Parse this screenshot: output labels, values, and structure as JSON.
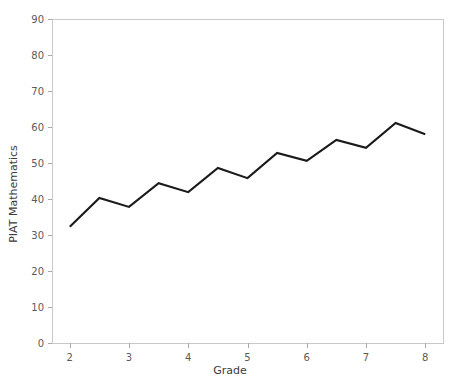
{
  "chart_data": {
    "type": "line",
    "title": "",
    "xlabel": "Grade",
    "ylabel": "PIAT Mathematics",
    "xlim": [
      1.7,
      8.3
    ],
    "ylim": [
      0,
      90
    ],
    "xticks": [
      2,
      3,
      4,
      5,
      6,
      7,
      8
    ],
    "yticks": [
      0,
      10,
      20,
      30,
      40,
      50,
      60,
      70,
      80,
      90
    ],
    "xtick_labels": [
      "2",
      "3",
      "4",
      "5",
      "6",
      "7",
      "8"
    ],
    "ytick_labels": [
      "0",
      "10",
      "20",
      "30",
      "40",
      "50",
      "60",
      "70",
      "80",
      "90"
    ],
    "grid": false,
    "legend": false,
    "series": [
      {
        "name": "PIAT Mathematics",
        "color": "#1a1a1a",
        "x": [
          2.0,
          2.5,
          3.0,
          3.5,
          4.0,
          4.5,
          5.0,
          5.5,
          6.0,
          6.5,
          7.0,
          7.5,
          8.0
        ],
        "values": [
          32.3,
          40.3,
          37.8,
          44.4,
          41.9,
          48.6,
          45.8,
          52.8,
          50.6,
          56.4,
          54.2,
          61.1,
          58.0
        ]
      }
    ]
  },
  "axes": {
    "x_title": "Grade",
    "y_title": "PIAT Mathematics"
  }
}
